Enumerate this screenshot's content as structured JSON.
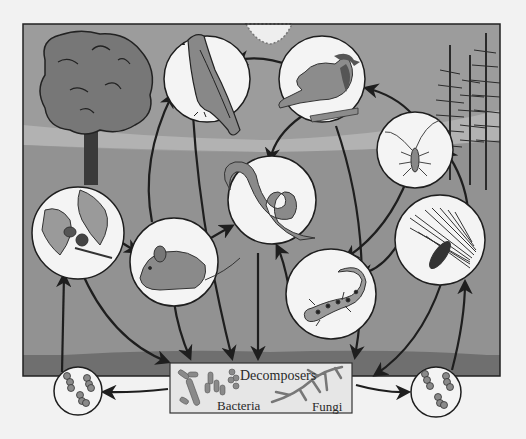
{
  "colors": {
    "page": "#f2f2f2",
    "sky_top": "#9a9a9a",
    "sky_band": "#b4b4b4",
    "ground": "#8e8e8e",
    "soil": "#6e6e6e",
    "circle": "#f4f4f4",
    "ink": "#1e1e1e",
    "organism": "#8a8a8a"
  },
  "decomposers": {
    "heading": "Decomposers",
    "bacteria": "Bacteria",
    "fungi": "Fungi"
  },
  "organisms": [
    {
      "id": "hawk",
      "name": "Hawk"
    },
    {
      "id": "songbird",
      "name": "Songbird"
    },
    {
      "id": "beetle",
      "name": "Beetle"
    },
    {
      "id": "snake",
      "name": "Snake"
    },
    {
      "id": "oak-leaves",
      "name": "Oak leaves and acorns"
    },
    {
      "id": "mouse",
      "name": "Mouse"
    },
    {
      "id": "pine-needles",
      "name": "Pine needles and cone"
    },
    {
      "id": "salamander",
      "name": "Salamander"
    },
    {
      "id": "nutrients-left",
      "name": "Soil nutrients"
    },
    {
      "id": "nutrients-right",
      "name": "Soil nutrients"
    }
  ],
  "links": [
    {
      "from": "songbird",
      "to": "hawk"
    },
    {
      "from": "mouse",
      "to": "hawk"
    },
    {
      "from": "beetle",
      "to": "songbird"
    },
    {
      "from": "songbird",
      "to": "snake"
    },
    {
      "from": "mouse",
      "to": "snake"
    },
    {
      "from": "salamander",
      "to": "snake"
    },
    {
      "from": "oak-leaves",
      "to": "mouse"
    },
    {
      "from": "beetle",
      "to": "salamander"
    },
    {
      "from": "pine-needles",
      "to": "salamander"
    },
    {
      "from": "pine-needles",
      "to": "beetle"
    },
    {
      "from": "nutrients-left",
      "to": "oak-leaves"
    },
    {
      "from": "nutrients-right",
      "to": "pine-needles"
    },
    {
      "from": "decomposers",
      "to": "nutrients-left"
    },
    {
      "from": "decomposers",
      "to": "nutrients-right"
    },
    {
      "from": "hawk",
      "to": "decomposers"
    },
    {
      "from": "songbird",
      "to": "decomposers"
    },
    {
      "from": "snake",
      "to": "decomposers"
    },
    {
      "from": "mouse",
      "to": "decomposers"
    },
    {
      "from": "oak-leaves",
      "to": "decomposers"
    },
    {
      "from": "salamander",
      "to": "decomposers"
    },
    {
      "from": "pine-needles",
      "to": "decomposers"
    }
  ]
}
